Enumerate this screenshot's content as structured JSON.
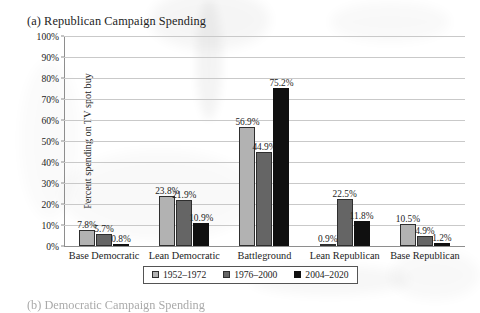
{
  "figure": {
    "title": "(a) Republican Campaign Spending",
    "next_figure_title": "(b) Democratic Campaign Spending"
  },
  "chart_data": {
    "type": "bar",
    "title": "(a) Republican Campaign Spending",
    "xlabel": "",
    "ylabel": "Percent spending on TV spot buy",
    "ylim": [
      0,
      100
    ],
    "ytick_labels": [
      "0%",
      "10%",
      "20%",
      "30%",
      "40%",
      "50%",
      "60%",
      "70%",
      "80%",
      "90%",
      "100%"
    ],
    "ytick_values": [
      0,
      10,
      20,
      30,
      40,
      50,
      60,
      70,
      80,
      90,
      100
    ],
    "grid": true,
    "legend_position": "bottom",
    "categories": [
      "Base Democratic",
      "Lean Democratic",
      "Battleground",
      "Lean Republican",
      "Base Republican"
    ],
    "series": [
      {
        "name": "1952–1972",
        "color": "#b2b2b2",
        "values": [
          7.8,
          23.8,
          56.9,
          0.9,
          10.5
        ],
        "labels": [
          "7.8%",
          "23.8%",
          "56.9%",
          "0.9%",
          "10.5%"
        ]
      },
      {
        "name": "1976–2000",
        "color": "#656565",
        "values": [
          5.7,
          21.9,
          44.9,
          22.5,
          4.9
        ],
        "labels": [
          "5.7%",
          "21.9%",
          "44.9%",
          "22.5%",
          "4.9%"
        ]
      },
      {
        "name": "2004–2020",
        "color": "#101010",
        "values": [
          0.8,
          10.9,
          75.2,
          11.8,
          1.2
        ],
        "labels": [
          "0.8%",
          "10.9%",
          "75.2%",
          "11.8%",
          "1.2%"
        ]
      }
    ]
  }
}
